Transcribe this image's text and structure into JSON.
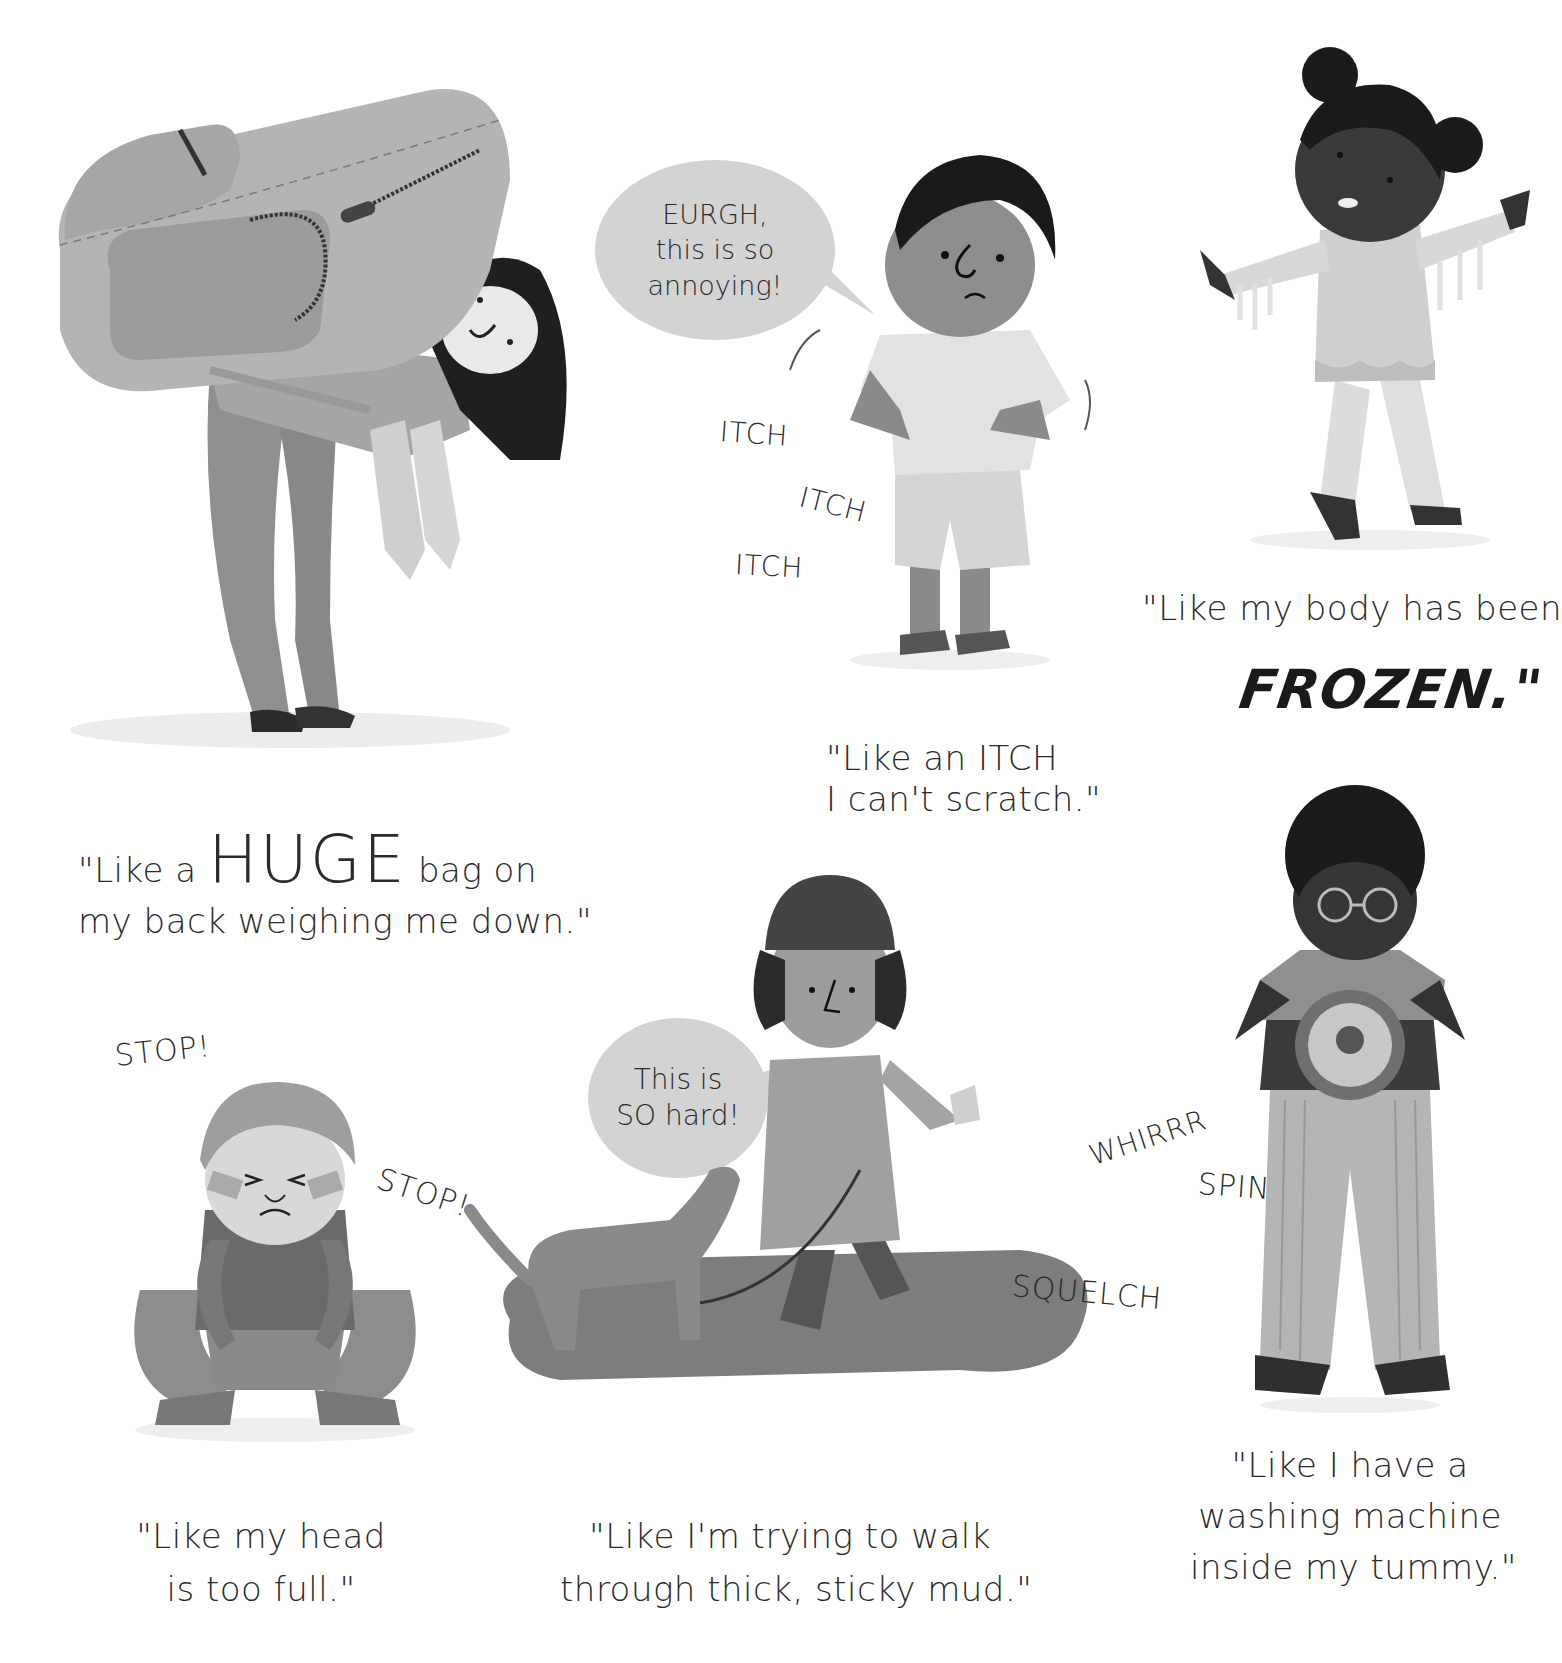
{
  "panels": [
    {
      "id": "heavy-bag",
      "caption": {
        "prefix": "\"Like a",
        "emphasis": "HUGE",
        "suffix": "bag on",
        "line2": "my back weighing me down.\""
      },
      "illustration": "girl bent over carrying a huge backpack"
    },
    {
      "id": "itch",
      "bubble": {
        "line1": "EURGH,",
        "line2": "this is so",
        "line3": "annoying!"
      },
      "sfx": [
        "ITCH",
        "ITCH",
        "ITCH"
      ],
      "caption": {
        "line1": "\"Like an ITCH",
        "line2": "I can't scratch.\""
      },
      "illustration": "boy scratching his tummy"
    },
    {
      "id": "frozen",
      "caption": {
        "line1": "\"Like my body has been",
        "emphasis": "FROZEN.\""
      },
      "illustration": "girl covered in icicles"
    },
    {
      "id": "head-full",
      "sfx": [
        "STOP!",
        "STOP!"
      ],
      "caption": {
        "line1": "\"Like my head",
        "line2": "is too full.\""
      },
      "illustration": "boy squatting holding his head"
    },
    {
      "id": "mud",
      "bubble": {
        "line1": "This is",
        "line2": "SO hard!"
      },
      "sfx": [
        "SQUELCH"
      ],
      "caption": {
        "line1": "\"Like I'm trying to walk",
        "line2": "through thick, sticky mud.\""
      },
      "illustration": "child walking a dog through mud"
    },
    {
      "id": "washing-machine",
      "sfx": [
        "WHIRRR",
        "SPIN"
      ],
      "caption": {
        "line1": "\"Like I have a",
        "line2": "washing machine",
        "line3": "inside my tummy.\""
      },
      "illustration": "boy with a washing machine in his tummy"
    }
  ],
  "colors": {
    "background": "#ffffff",
    "bubble": "#d3d3d3",
    "text": "#2a2a2a",
    "dark_skin": "#3a3a3a",
    "mid_gray": "#8a8a8a",
    "light_gray": "#bdbdbd"
  }
}
